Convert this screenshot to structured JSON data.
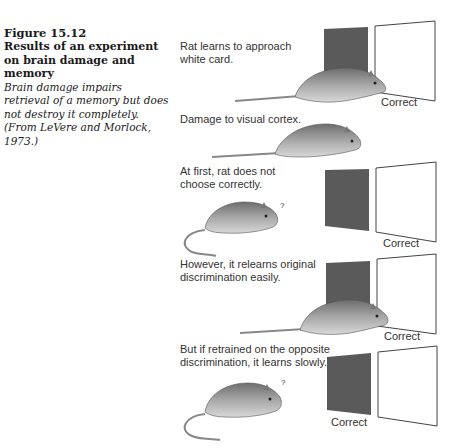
{
  "caption": {
    "figure_number": "Figure 15.12",
    "title": "Results of an experiment on brain damage and memory",
    "body": "Brain damage impairs retrieval of a memory but does not destroy it completely. (From LeVere and Morlock, 1973.)"
  },
  "panels": [
    {
      "label": "Rat learns to approach white card.",
      "correct_label": "Correct",
      "correct_card": "white"
    },
    {
      "label": "Damage to visual cortex."
    },
    {
      "label": "At first, rat does not choose correctly.",
      "correct_label": "Correct",
      "correct_card": "white",
      "question_mark": "?"
    },
    {
      "label": "However, it relearns original discrimination easily.",
      "correct_label": "Correct",
      "correct_card": "white"
    },
    {
      "label": "But if retrained on the opposite discrimination, it learns slowly.",
      "correct_label": "Correct",
      "correct_card": "dark",
      "question_mark": "?"
    }
  ],
  "colors": {
    "dark_card": "#5a5a5a",
    "card_outline": "#444444",
    "text": "#333333"
  }
}
